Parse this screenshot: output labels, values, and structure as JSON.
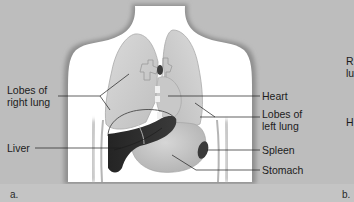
{
  "figure": {
    "panel_a_letter": "a.",
    "panel_b_letter": "b.",
    "colors": {
      "background": "#bdbdbd",
      "body": "#ffffff",
      "body_shadow": "#9a9a9a",
      "organ_light": "#d2d2d2",
      "organ_mid": "#c4c4c4",
      "liver": "#2e2e2e",
      "spleen": "#3a3a3a",
      "leader_line": "#1c1c1c"
    },
    "labels_left": {
      "right_lung_line1": "Lobes of",
      "right_lung_line2": "right lung",
      "liver": "Liver"
    },
    "labels_right": {
      "heart": "Heart",
      "left_lung_line1": "Lobes of",
      "left_lung_line2": "left lung",
      "spleen": "Spleen",
      "stomach": "Stomach"
    },
    "cropped_panel_b_fragments": {
      "r1": "R",
      "r2": "lu",
      "h": "H"
    }
  }
}
